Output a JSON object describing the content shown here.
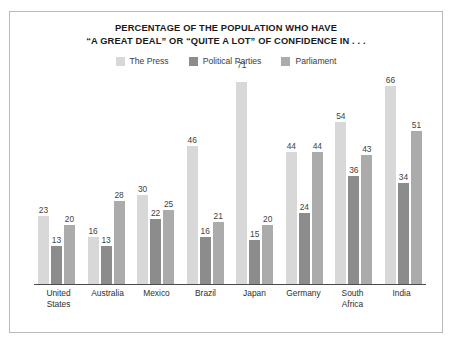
{
  "title": {
    "line1": "PERCENTAGE OF THE POPULATION WHO HAVE",
    "line2": "“A GREAT DEAL” OR “QUITE A LOT” OF CONFIDENCE IN . . ."
  },
  "colors": {
    "press": "#d8d8d8",
    "political_parties": "#8c8c8c",
    "parliament": "#ababab",
    "axis": "#4a4a4a",
    "frame": "#b9b9b9",
    "value_text": "#434343",
    "title_text": "#1a1a1a"
  },
  "legend": {
    "items": [
      {
        "label": "The Press",
        "color_key": "press"
      },
      {
        "label": "Political Parties",
        "color_key": "political_parties"
      },
      {
        "label": "Parliament",
        "color_key": "parliament"
      }
    ]
  },
  "chart_data": {
    "type": "bar",
    "title": "PERCENTAGE OF THE POPULATION WHO HAVE “A GREAT DEAL” OR “QUITE A LOT” OF CONFIDENCE IN . . .",
    "xlabel": "",
    "ylabel": "",
    "ylim": [
      0,
      71
    ],
    "grid": false,
    "legend_position": "top-center",
    "categories": [
      "United States",
      "Australia",
      "Mexico",
      "Brazil",
      "Japan",
      "Germany",
      "South Africa",
      "India"
    ],
    "category_lines": [
      [
        "United",
        "States"
      ],
      [
        "Australia"
      ],
      [
        "Mexico"
      ],
      [
        "Brazil"
      ],
      [
        "Japan"
      ],
      [
        "Germany"
      ],
      [
        "South",
        "Africa"
      ],
      [
        "India"
      ]
    ],
    "series": [
      {
        "name": "The Press",
        "color_key": "press",
        "values": [
          23,
          16,
          30,
          46,
          71,
          44,
          54,
          66
        ]
      },
      {
        "name": "Political Parties",
        "color_key": "political_parties",
        "values": [
          13,
          13,
          22,
          16,
          15,
          24,
          36,
          34
        ]
      },
      {
        "name": "Parliament",
        "color_key": "parliament",
        "values": [
          20,
          28,
          25,
          21,
          20,
          44,
          43,
          51
        ]
      }
    ]
  }
}
